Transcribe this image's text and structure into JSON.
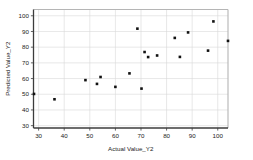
{
  "chart_data": {
    "type": "scatter",
    "title": "",
    "xlabel": "Actual Value_Y2",
    "ylabel": "Predicted Value_Y2",
    "xlim": [
      28,
      104
    ],
    "ylim": [
      28.5,
      104
    ],
    "xticks": [
      30,
      40,
      50,
      60,
      70,
      80,
      90,
      100
    ],
    "yticks": [
      30,
      40,
      50,
      60,
      70,
      80,
      90,
      100
    ],
    "grid": true,
    "legend": "none",
    "marker": {
      "shape": "square",
      "color": "#111111",
      "size": 2.6
    },
    "points": [
      {
        "x": 28.2,
        "y": 50.2
      },
      {
        "x": 36.2,
        "y": 46.8
      },
      {
        "x": 48.3,
        "y": 59.0
      },
      {
        "x": 52.8,
        "y": 56.6
      },
      {
        "x": 54.2,
        "y": 61.0
      },
      {
        "x": 60.0,
        "y": 54.7
      },
      {
        "x": 65.5,
        "y": 63.3
      },
      {
        "x": 68.6,
        "y": 91.8
      },
      {
        "x": 70.2,
        "y": 53.6
      },
      {
        "x": 71.4,
        "y": 76.9
      },
      {
        "x": 72.8,
        "y": 73.7
      },
      {
        "x": 76.3,
        "y": 74.7
      },
      {
        "x": 83.2,
        "y": 85.9
      },
      {
        "x": 85.2,
        "y": 73.8
      },
      {
        "x": 88.4,
        "y": 89.4
      },
      {
        "x": 96.2,
        "y": 77.8
      },
      {
        "x": 98.3,
        "y": 96.4
      },
      {
        "x": 104.0,
        "y": 84.0
      }
    ]
  }
}
